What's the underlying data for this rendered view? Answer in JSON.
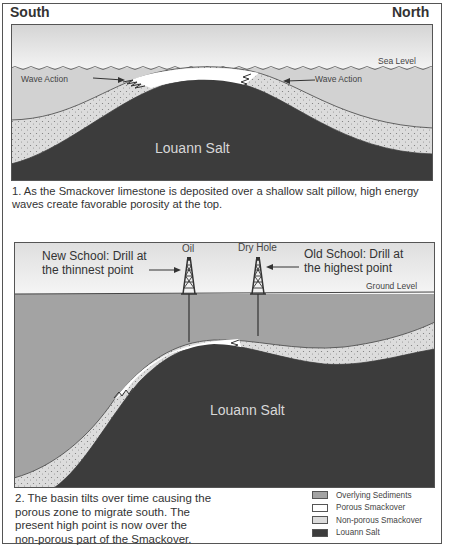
{
  "directions": {
    "south": "South",
    "north": "North"
  },
  "panel1": {
    "sea_level_label": "Sea Level",
    "wave_action_left": "Wave Action",
    "wave_action_right": "Wave Action",
    "salt_label": "Louann Salt",
    "caption": "1. As the Smackover limestone is deposited over a shallow salt pillow, high energy waves create favorable porosity at the top."
  },
  "panel2": {
    "new_school_line1": "New School: Drill at",
    "new_school_line2": "the thinnest point",
    "old_school_line1": "Old School: Drill at",
    "old_school_line2": "the highest point",
    "oil_label": "Oil",
    "dry_hole_label": "Dry Hole",
    "ground_level_label": "Ground Level",
    "salt_label": "Louann Salt",
    "caption_lines": [
      "2. The basin tilts over time causing the",
      "porous zone to migrate south. The",
      "present high point is now over the",
      "non-porous part of the Smackover."
    ]
  },
  "legend": {
    "items": [
      {
        "label": "Overlying Sediments",
        "swatch": "overlying-sediments",
        "color": "#a3a3a3"
      },
      {
        "label": "Porous Smackover",
        "swatch": "porous-smackover",
        "color": "#ffffff"
      },
      {
        "label": "Non-porous Smackover",
        "swatch": "non-porous-smackover",
        "color": "#dcdcdc"
      },
      {
        "label": "Louann Salt",
        "swatch": "louann-salt",
        "color": "#3c3c3c"
      }
    ]
  },
  "colors": {
    "salt": "#3c3c3c",
    "sediments": "#a3a3a3",
    "water": "#d2d2d2",
    "sky": "#ededed",
    "nonporous": "#dcdcdc",
    "porous": "#ffffff"
  }
}
